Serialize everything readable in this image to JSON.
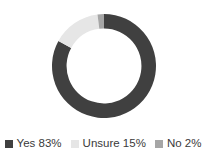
{
  "background_color": "#ffffff",
  "text_color": "#3a3a3a",
  "legend": {
    "position": "bottom",
    "items": [
      {
        "label": "Yes 83%",
        "name": "Yes",
        "value": 83,
        "color": "#404040",
        "swatch": "square-swatch-icon"
      },
      {
        "label": "Unsure 15%",
        "name": "Unsure",
        "value": 15,
        "color": "#e6e6e6",
        "swatch": "square-swatch-icon"
      },
      {
        "label": "No 2%",
        "name": "No",
        "value": 2,
        "color": "#a6a6a6",
        "swatch": "square-swatch-icon"
      }
    ]
  },
  "chart_data": {
    "type": "pie",
    "variant": "donut",
    "title": "",
    "subtitle": "",
    "xlabel": "",
    "ylabel": "",
    "grid": false,
    "legend_position": "bottom",
    "start_angle_deg": 0,
    "direction": "clockwise",
    "hole_ratio": 0.72,
    "units": "percent",
    "categories": [
      "Yes",
      "Unsure",
      "No"
    ],
    "values": [
      83,
      15,
      2
    ],
    "labels": [
      "Yes 83%",
      "Unsure 15%",
      "No 2%"
    ],
    "colors": [
      "#404040",
      "#e6e6e6",
      "#a6a6a6"
    ],
    "slices": [
      {
        "name": "Yes",
        "value": 83,
        "label": "Yes 83%",
        "color": "#404040",
        "start_deg": 0,
        "end_deg": 298.8
      },
      {
        "name": "Unsure",
        "value": 15,
        "label": "Unsure 15%",
        "color": "#e6e6e6",
        "start_deg": 298.8,
        "end_deg": 352.8
      },
      {
        "name": "No",
        "value": 2,
        "label": "No 2%",
        "color": "#a6a6a6",
        "start_deg": 352.8,
        "end_deg": 360
      }
    ],
    "total": 100
  }
}
